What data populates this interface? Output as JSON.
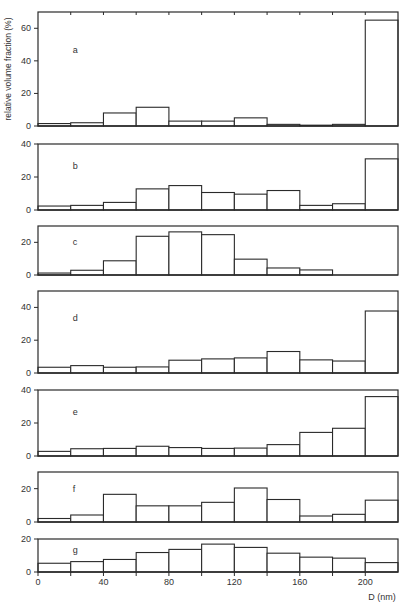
{
  "chart_data": {
    "type": "bar",
    "layout": "vertically stacked histogram panels sharing x-axis",
    "xlabel": "D (nm)",
    "ylabel": "relative volume fraction (%)",
    "x_ticks": [
      0,
      40,
      80,
      120,
      160,
      200
    ],
    "x_range": [
      0,
      220
    ],
    "bin_edges": [
      0,
      20,
      40,
      60,
      80,
      100,
      120,
      140,
      160,
      180,
      200,
      220
    ],
    "categories": [
      "0-20",
      "20-40",
      "40-60",
      "60-80",
      "80-100",
      "100-120",
      "120-140",
      "140-160",
      "160-180",
      "180-200",
      "200-220"
    ],
    "grid": false,
    "legend": null,
    "panels": [
      {
        "label": "a",
        "ylim": [
          0,
          70
        ],
        "y_ticks": [
          0,
          20,
          40,
          60
        ],
        "values": [
          1.5,
          2,
          8,
          11.5,
          3,
          3,
          5,
          1,
          0.5,
          1,
          65
        ]
      },
      {
        "label": "b",
        "ylim": [
          0,
          40
        ],
        "y_ticks": [
          0,
          20,
          40
        ],
        "values": [
          2.4,
          2.8,
          4.6,
          12.8,
          14.8,
          10.6,
          9.6,
          11.8,
          2.8,
          3.8,
          31
        ]
      },
      {
        "label": "c",
        "ylim": [
          0,
          30
        ],
        "y_ticks": [
          0,
          20
        ],
        "values": [
          1.2,
          2.9,
          8.7,
          23.7,
          26.4,
          24.7,
          9.7,
          4.3,
          3.1,
          0,
          0
        ]
      },
      {
        "label": "d",
        "ylim": [
          0,
          50
        ],
        "y_ticks": [
          0,
          20,
          40
        ],
        "values": [
          3.5,
          4.5,
          3.5,
          3.7,
          7.8,
          8.6,
          9.2,
          13.1,
          8,
          7.3,
          37.8
        ]
      },
      {
        "label": "e",
        "ylim": [
          0,
          40
        ],
        "y_ticks": [
          0,
          20,
          40
        ],
        "values": [
          2.8,
          4.4,
          4.6,
          5.9,
          5.1,
          4.6,
          4.8,
          6.9,
          14.3,
          16.8,
          36
        ]
      },
      {
        "label": "f",
        "ylim": [
          0,
          30
        ],
        "y_ticks": [
          0,
          20
        ],
        "values": [
          2.1,
          4.2,
          16.6,
          9.7,
          9.7,
          11.8,
          20.4,
          13.5,
          3.6,
          4.6,
          13.1
        ]
      },
      {
        "label": "g",
        "ylim": [
          0,
          20
        ],
        "y_ticks": [
          0,
          20
        ],
        "values": [
          5.3,
          6.3,
          7.6,
          11.8,
          13.7,
          16.9,
          14.9,
          11.4,
          9,
          8.4,
          5.7
        ]
      }
    ]
  },
  "figure": {
    "plot_left": 38,
    "plot_right": 398,
    "panel_boxes": [
      {
        "top": 12,
        "bottom": 126
      },
      {
        "top": 144,
        "bottom": 210
      },
      {
        "top": 226,
        "bottom": 275
      },
      {
        "top": 291,
        "bottom": 373
      },
      {
        "top": 390,
        "bottom": 456
      },
      {
        "top": 472,
        "bottom": 522
      },
      {
        "top": 539,
        "bottom": 572
      }
    ],
    "xlabel_y": 585,
    "xtitle_x": 382,
    "xtitle_y": 600
  }
}
